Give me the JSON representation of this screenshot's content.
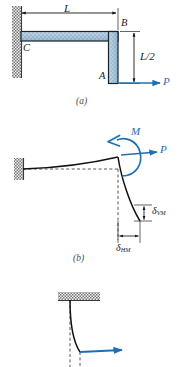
{
  "figure": {
    "kind": "engineering-diagram",
    "colors": {
      "member_fill_light": "#b9cfe0",
      "member_fill_mid": "#8fb0c9",
      "member_outline": "#1a2a36",
      "load_blue": "#1f6fb4",
      "line_black": "#151515",
      "hatch_gray": "#6e6e6e",
      "background": "#ffffff"
    }
  },
  "panel_a": {
    "caption": "(a)",
    "dim_L": "L",
    "dim_half_L": "L/2",
    "point_C": "C",
    "point_B": "B",
    "point_A": "A",
    "load_P": "P"
  },
  "panel_b": {
    "caption": "(b)",
    "moment_M": "M",
    "load_P": "P",
    "delta_v": "δ",
    "delta_v_sub": "VM",
    "delta_h": "δ",
    "delta_h_sub": "HM"
  },
  "panel_c": {
    "caption": ""
  }
}
